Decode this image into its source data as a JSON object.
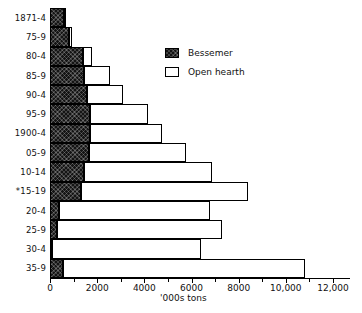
{
  "chart_data": {
    "type": "bar",
    "orientation": "horizontal",
    "stacked": true,
    "title": "",
    "xlabel": "'000s tons",
    "ylabel": "",
    "xlim": [
      0,
      12000
    ],
    "x_major_ticks": [
      0,
      2000,
      4000,
      6000,
      8000,
      10000,
      12000
    ],
    "x_tick_labels": [
      "0",
      "2000",
      "4000",
      "6000",
      "8000",
      "10,000",
      "12,000"
    ],
    "x_minor_ticks": [
      1000,
      3000,
      5000,
      7000,
      9000,
      11000
    ],
    "grid": false,
    "legend_position": "upper-center-right",
    "categories": [
      "1871-4",
      "75-9",
      "80-4",
      "85-9",
      "90-4",
      "95-9",
      "1900-4",
      "05-9",
      "10-14",
      "*15-19",
      "20-4",
      "25-9",
      "30-4",
      "35-9"
    ],
    "series": [
      {
        "name": "Bessemer",
        "color": "#141414",
        "pattern": "dark-crosshatch",
        "values": [
          600,
          800,
          1400,
          1450,
          1550,
          1700,
          1700,
          1650,
          1450,
          1300,
          400,
          300,
          100,
          550
        ]
      },
      {
        "name": "Open hearth",
        "color": "#ffffff",
        "pattern": "white-outline",
        "values": [
          100,
          150,
          400,
          1100,
          1550,
          2450,
          3050,
          4100,
          5400,
          7100,
          6400,
          7000,
          6300,
          10250
        ]
      }
    ],
    "colors": {
      "outline": "#000000",
      "background": "#ffffff",
      "text": "#111111"
    }
  }
}
